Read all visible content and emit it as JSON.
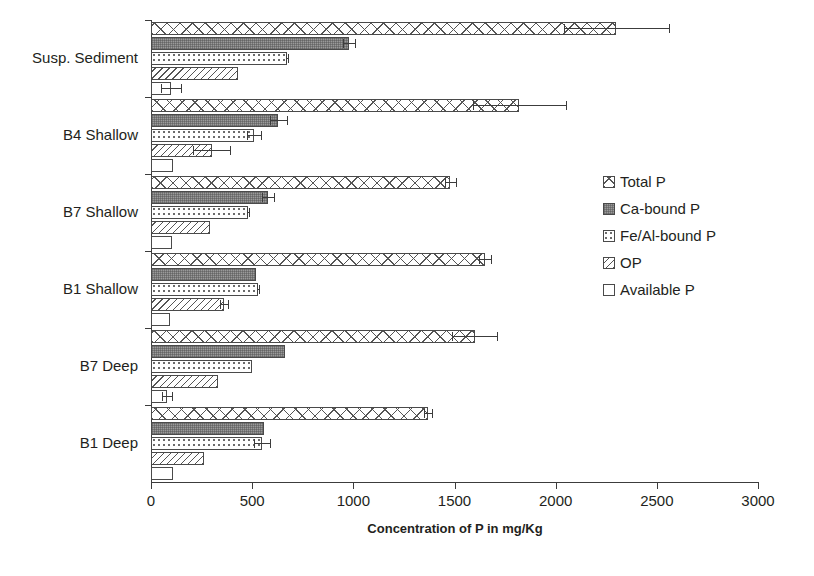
{
  "chart_data": {
    "type": "bar",
    "orientation": "horizontal",
    "title": "",
    "xlabel": "Concentration of P in mg/Kg",
    "ylabel": "",
    "xlim": [
      0,
      3000
    ],
    "xticks": [
      0,
      500,
      1000,
      1500,
      2000,
      2500,
      3000
    ],
    "xtick_labels": [
      "0",
      "500",
      "1000",
      "1500",
      "2000",
      "2500",
      "3000"
    ],
    "grid": false,
    "legend_position": "right",
    "categories": [
      "Susp. Sediment",
      "B4 Shallow",
      "B7 Shallow",
      "B1 Shallow",
      "B7 Deep",
      "B1 Deep"
    ],
    "series": [
      {
        "name": "Total P",
        "pattern": "cross-hatch",
        "values": [
          2300,
          1820,
          1480,
          1650,
          1600,
          1370
        ],
        "errors": [
          260,
          230,
          25,
          30,
          110,
          20
        ]
      },
      {
        "name": "Ca-bound P",
        "pattern": "solid-dark-gray",
        "values": [
          980,
          630,
          580,
          520,
          660,
          560
        ],
        "errors": [
          30,
          40,
          30,
          0,
          0,
          0
        ]
      },
      {
        "name": "Fe/Al-bound P",
        "pattern": "dotted",
        "values": [
          670,
          510,
          480,
          530,
          500,
          550
        ],
        "errors": [
          5,
          35,
          5,
          5,
          0,
          40
        ]
      },
      {
        "name": "OP",
        "pattern": "diagonal-hatch",
        "values": [
          430,
          300,
          290,
          360,
          330,
          260
        ],
        "errors": [
          0,
          90,
          0,
          20,
          0,
          0
        ]
      },
      {
        "name": "Available P",
        "pattern": "white",
        "values": [
          100,
          110,
          105,
          95,
          80,
          110
        ],
        "errors": [
          50,
          0,
          0,
          0,
          25,
          0
        ]
      }
    ]
  },
  "legend": {
    "items": [
      {
        "label": "Total P"
      },
      {
        "label": "Ca-bound P"
      },
      {
        "label": "Fe/Al-bound P"
      },
      {
        "label": "OP"
      },
      {
        "label": "Available P"
      }
    ]
  },
  "axis": {
    "x_title": "Concentration of P in mg/Kg"
  }
}
